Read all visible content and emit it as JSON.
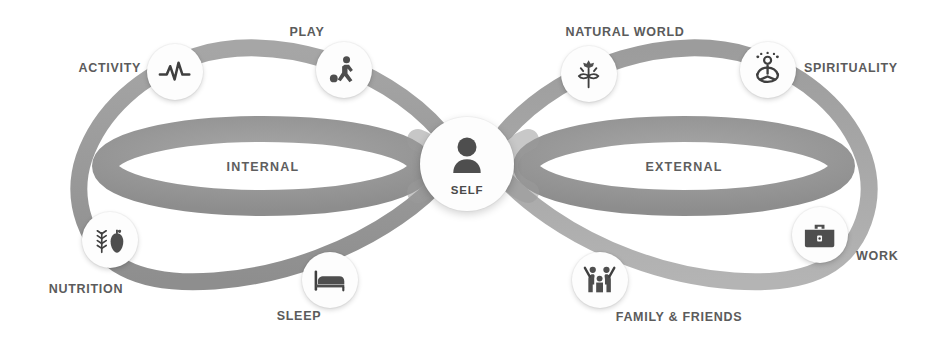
{
  "diagram": {
    "background_color": "#ffffff",
    "ribbon_color": "#9b9b9b",
    "label_color": "#5b5b5b",
    "icon_color": "#4e4e4e",
    "node_fill": "#fdfdfd",
    "center": {
      "label": "SELF",
      "icon": "person-icon"
    },
    "loops": [
      {
        "id": "internal",
        "label": "INTERNAL",
        "side": "left"
      },
      {
        "id": "external",
        "label": "EXTERNAL",
        "side": "right"
      }
    ],
    "nodes": [
      {
        "id": "activity",
        "label": "ACTIVITY",
        "icon": "heartbeat-pulse-icon",
        "loop": "internal",
        "position": "top-left-outer"
      },
      {
        "id": "play",
        "label": "PLAY",
        "icon": "soccer-player-icon",
        "loop": "internal",
        "position": "top-left-inner"
      },
      {
        "id": "nutrition",
        "label": "NUTRITION",
        "icon": "wheat-apple-icon",
        "loop": "internal",
        "position": "bottom-left-outer"
      },
      {
        "id": "sleep",
        "label": "SLEEP",
        "icon": "bed-icon",
        "loop": "internal",
        "position": "bottom-left-inner"
      },
      {
        "id": "natural-world",
        "label": "NATURAL WORLD",
        "icon": "plant-flower-icon",
        "loop": "external",
        "position": "top-right-inner"
      },
      {
        "id": "spirituality",
        "label": "SPIRITUALITY",
        "icon": "meditation-lotus-icon",
        "loop": "external",
        "position": "top-right-outer"
      },
      {
        "id": "family-friends",
        "label": "FAMILY & FRIENDS",
        "icon": "family-raised-arms-icon",
        "loop": "external",
        "position": "bottom-right-inner"
      },
      {
        "id": "work",
        "label": "WORK",
        "icon": "briefcase-icon",
        "loop": "external",
        "position": "bottom-right-outer"
      }
    ]
  }
}
